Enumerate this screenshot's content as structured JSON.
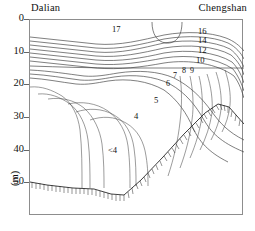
{
  "chart_data": {
    "type": "line",
    "title": "",
    "subtitle": "",
    "xlabel": "",
    "ylabel": "(m)",
    "x_endpoints": [
      "Dalian",
      "Chengshan"
    ],
    "ylim": [
      0,
      60
    ],
    "y_ticks": [
      0,
      10,
      20,
      30,
      40,
      50
    ],
    "y_tick_labels": [
      "0",
      "10",
      "20",
      "30",
      "40",
      "50"
    ],
    "y_axis_unit": "(m)",
    "y_axis_direction": "depth-increases-downward",
    "grid": false,
    "legend": false,
    "variable": "temperature",
    "contour_interval": 1,
    "contour_labels": [
      {
        "value": "17",
        "x_frac": 0.4,
        "depth_m": 2.8
      },
      {
        "value": "16",
        "x_frac": 0.79,
        "depth_m": 3.2
      },
      {
        "value": "14",
        "x_frac": 0.79,
        "depth_m": 5.3
      },
      {
        "value": "12",
        "x_frac": 0.79,
        "depth_m": 7.6
      },
      {
        "value": "10",
        "x_frac": 0.79,
        "depth_m": 9.8
      },
      {
        "value": "9",
        "x_frac": 0.745,
        "depth_m": 13.2
      },
      {
        "value": "8",
        "x_frac": 0.715,
        "depth_m": 13.4
      },
      {
        "value": "7",
        "x_frac": 0.675,
        "depth_m": 14.8
      },
      {
        "value": "6",
        "x_frac": 0.645,
        "depth_m": 17.2
      },
      {
        "value": "5",
        "x_frac": 0.585,
        "depth_m": 22.5
      },
      {
        "value": "4",
        "x_frac": 0.495,
        "depth_m": 28.0
      },
      {
        "value": "<4",
        "x_frac": 0.385,
        "depth_m": 38.5
      }
    ],
    "contour_values": [
      17,
      16,
      15,
      14,
      13,
      12,
      11,
      10,
      9,
      8,
      7,
      6,
      5,
      4
    ],
    "core_label": "<4",
    "seabed": {
      "label": "seafloor",
      "hatched": true,
      "points": [
        {
          "x_frac": 0.0,
          "depth_m": 49.5
        },
        {
          "x_frac": 0.08,
          "depth_m": 50.6
        },
        {
          "x_frac": 0.2,
          "depth_m": 51.4
        },
        {
          "x_frac": 0.3,
          "depth_m": 51.8
        },
        {
          "x_frac": 0.38,
          "depth_m": 53.2
        },
        {
          "x_frac": 0.44,
          "depth_m": 53.6
        },
        {
          "x_frac": 0.52,
          "depth_m": 49.0
        },
        {
          "x_frac": 0.62,
          "depth_m": 42.0
        },
        {
          "x_frac": 0.72,
          "depth_m": 35.0
        },
        {
          "x_frac": 0.82,
          "depth_m": 28.4
        },
        {
          "x_frac": 0.88,
          "depth_m": 25.8
        },
        {
          "x_frac": 0.93,
          "depth_m": 26.6
        },
        {
          "x_frac": 1.0,
          "depth_m": 31.8
        }
      ]
    }
  },
  "labels": {
    "left_station": "Dalian",
    "right_station": "Chengshan",
    "depth_unit": "(m)"
  },
  "colors": {
    "contour_line": "#3a3a3a",
    "seabed_line": "#2a2a2a",
    "frame": "#8d8d8d",
    "text": "#111111",
    "background": "#ffffff"
  }
}
